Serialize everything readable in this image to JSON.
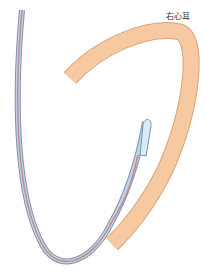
{
  "diagram": {
    "label": "右心耳",
    "colors": {
      "appendage_fill": "#f7c9a0",
      "appendage_stroke": "#d9a57c",
      "catheter_outer": "#7f8fb8",
      "catheter_mid": "#bfd6e4",
      "catheter_core": "#c98a8a",
      "tip_fill": "#d6ecf5"
    }
  }
}
